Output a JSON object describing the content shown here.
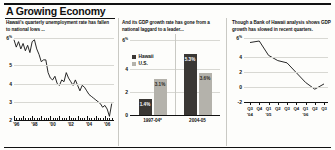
{
  "header": {
    "title": "A Growing Economy"
  },
  "panels": [
    {
      "deck": "Hawaii's quarterly unemployment rate has fallen to national lows ..."
    },
    {
      "deck": "And its GDP growth rate has gone from a national laggard to a leader..."
    },
    {
      "deck": "Though a Bank of Hawaii analysis shows GDP growth has slowed in recent quarters."
    }
  ],
  "chart_data": [
    {
      "type": "line",
      "title": "Hawaii's quarterly unemployment rate has fallen to national lows ...",
      "xlabel": "",
      "ylabel": "",
      "ylim": [
        2,
        6.5
      ],
      "yticks": [
        2,
        3,
        4,
        5,
        6.5
      ],
      "yticklabels": [
        "2",
        "3",
        "4",
        "5",
        "6"
      ],
      "ytick_top_suffix": "%",
      "grid": true,
      "xticklabels": [
        "'96",
        "'98",
        "'00",
        "'02",
        "'04",
        "'06"
      ],
      "xtick_years": [
        1996,
        1998,
        2000,
        2002,
        2004,
        2006
      ],
      "xlim": [
        1995.75,
        2006.75
      ],
      "series": [
        {
          "name": "Hawaii unemployment rate",
          "x": [
            1995.75,
            1996.0,
            1996.25,
            1996.5,
            1996.75,
            1997.0,
            1997.25,
            1997.5,
            1997.75,
            1998.0,
            1998.25,
            1998.5,
            1998.75,
            1999.0,
            1999.25,
            1999.5,
            1999.75,
            2000.0,
            2000.25,
            2000.5,
            2000.75,
            2001.0,
            2001.25,
            2001.5,
            2001.75,
            2002.0,
            2002.25,
            2002.5,
            2002.75,
            2003.0,
            2003.25,
            2003.5,
            2003.75,
            2004.0,
            2004.25,
            2004.5,
            2004.75,
            2005.0,
            2005.25,
            2005.5,
            2005.75,
            2006.0,
            2006.25,
            2006.5
          ],
          "y": [
            6.4,
            6.0,
            6.3,
            5.9,
            6.2,
            5.8,
            6.1,
            5.7,
            6.3,
            6.4,
            5.9,
            5.6,
            5.2,
            5.3,
            5.3,
            4.6,
            4.3,
            4.2,
            4.4,
            4.0,
            3.9,
            4.2,
            4.1,
            4.6,
            4.3,
            4.1,
            3.9,
            4.2,
            3.9,
            3.6,
            3.9,
            3.8,
            3.6,
            3.4,
            3.3,
            3.2,
            3.1,
            3.0,
            2.9,
            2.7,
            2.8,
            2.6,
            2.2,
            2.9
          ]
        }
      ]
    },
    {
      "type": "bar",
      "title": "And its GDP growth rate has gone from a national laggard to a leader...",
      "categories": [
        "1997-04*",
        "2004-05"
      ],
      "ylim": [
        0,
        6.5
      ],
      "yticks": [
        0,
        2,
        4,
        6.5
      ],
      "yticklabels": [
        "0",
        "2",
        "4",
        "6"
      ],
      "ytick_top_suffix": "%",
      "grid": true,
      "legend": [
        "Hawaii",
        "U.S."
      ],
      "legend_position": "upper-left",
      "series": [
        {
          "name": "Hawaii",
          "values": [
            1.4,
            5.3
          ],
          "labels": [
            "1.4%",
            "5.3%"
          ],
          "color": "#3a3734"
        },
        {
          "name": "U.S.",
          "values": [
            3.1,
            3.6
          ],
          "labels": [
            "3.1%",
            "3.6%"
          ],
          "color": "#b4b2ab"
        }
      ]
    },
    {
      "type": "line",
      "title": "Though a Bank of Hawaii analysis shows GDP growth has slowed in recent quarters.",
      "ylim": [
        -2,
        6.5
      ],
      "yticks": [
        -2,
        0,
        2,
        4,
        6.5
      ],
      "yticklabels": [
        "-2",
        "0",
        "2",
        "4",
        "6"
      ],
      "ytick_top_suffix": "%",
      "grid": true,
      "xticklabels": [
        "Q3",
        "Q4",
        "Q1",
        "Q2",
        "Q3",
        "Q4",
        "Q1",
        "Q2",
        "Q3"
      ],
      "xtick_years": [
        "'04",
        "",
        "'05",
        "",
        "",
        "",
        "'06",
        "",
        ""
      ],
      "series": [
        {
          "name": "Hawaii GDP growth",
          "x": [
            0,
            1,
            2,
            3,
            4,
            5,
            6,
            7,
            8
          ],
          "y": [
            5.9,
            6.1,
            4.2,
            3.5,
            3.2,
            1.9,
            0.6,
            -0.3,
            0.4
          ]
        }
      ]
    }
  ]
}
